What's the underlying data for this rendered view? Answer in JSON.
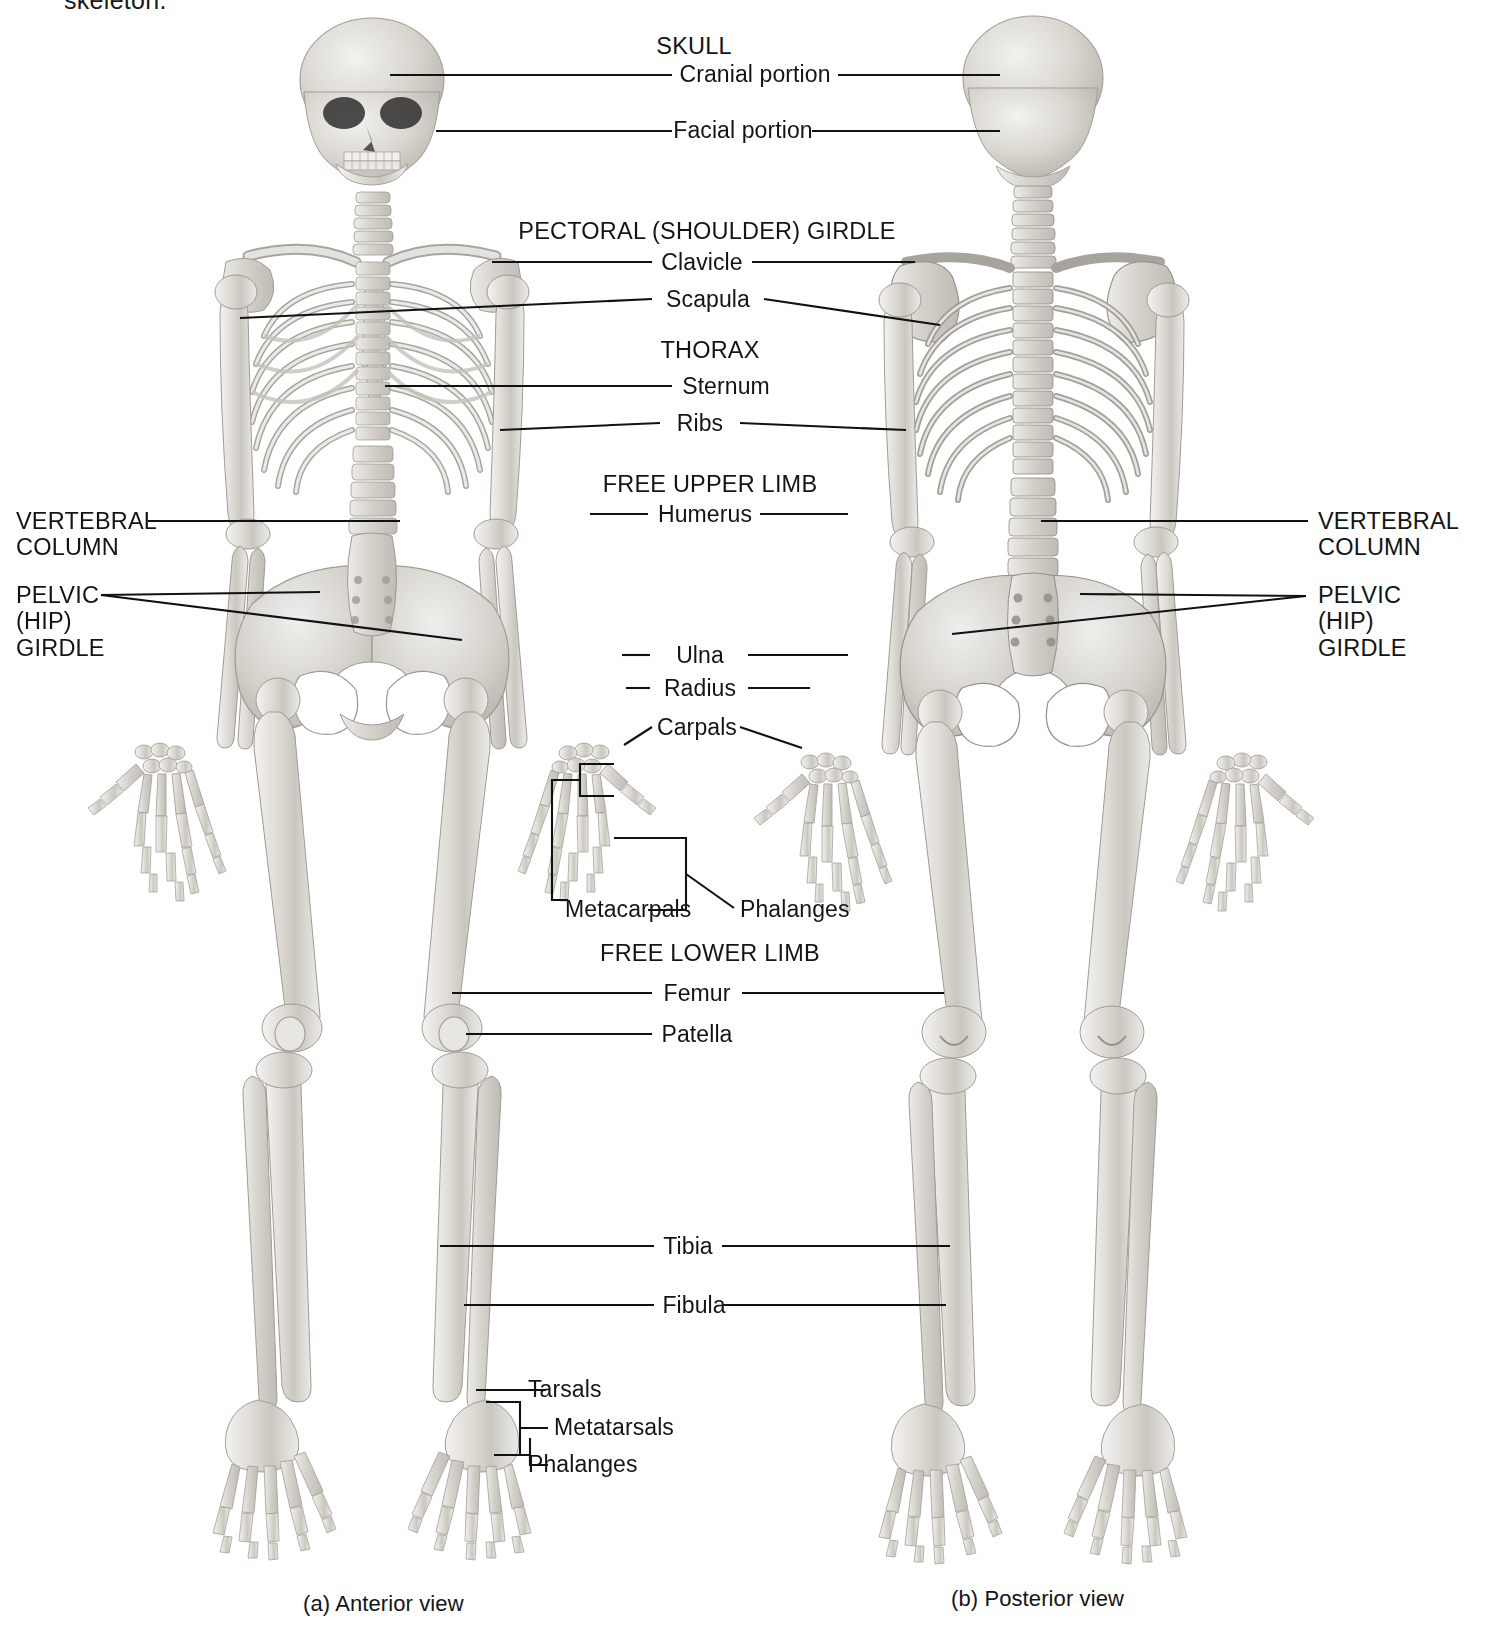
{
  "figure": {
    "type": "anatomy-diagram",
    "partial_top_text": "skeleton.",
    "background_color": "#ffffff",
    "bone_color": "#d9d7d2",
    "line_color": "#111111",
    "text_color": "#141414"
  },
  "captions": {
    "left": "(a) Anterior view",
    "right": "(b) Posterior view"
  },
  "group_headings": [
    {
      "id": "skull",
      "text": "SKULL"
    },
    {
      "id": "pectoral",
      "text": "PECTORAL (SHOULDER) GIRDLE"
    },
    {
      "id": "thorax",
      "text": "THORAX"
    },
    {
      "id": "free_upper",
      "text": "FREE UPPER LIMB"
    },
    {
      "id": "free_lower",
      "text": "FREE LOWER LIMB"
    }
  ],
  "center_labels": [
    {
      "id": "cranial_portion",
      "text": "Cranial portion"
    },
    {
      "id": "facial_portion",
      "text": "Facial portion"
    },
    {
      "id": "clavicle",
      "text": "Clavicle"
    },
    {
      "id": "scapula",
      "text": "Scapula"
    },
    {
      "id": "sternum",
      "text": "Sternum"
    },
    {
      "id": "ribs",
      "text": "Ribs"
    },
    {
      "id": "humerus",
      "text": "Humerus"
    },
    {
      "id": "ulna",
      "text": "Ulna"
    },
    {
      "id": "radius",
      "text": "Radius"
    },
    {
      "id": "carpals",
      "text": "Carpals"
    },
    {
      "id": "metacarpals",
      "text": "Metacarpals"
    },
    {
      "id": "phalanges_hand",
      "text": "Phalanges"
    },
    {
      "id": "femur",
      "text": "Femur"
    },
    {
      "id": "patella",
      "text": "Patella"
    },
    {
      "id": "tibia",
      "text": "Tibia"
    },
    {
      "id": "fibula",
      "text": "Fibula"
    },
    {
      "id": "tarsals",
      "text": "Tarsals"
    },
    {
      "id": "metatarsals",
      "text": "Metatarsals"
    },
    {
      "id": "phalanges_foot",
      "text": "Phalanges"
    }
  ],
  "side_labels": {
    "left": [
      {
        "id": "vertebral_column_left",
        "line1": "VERTEBRAL",
        "line2": "COLUMN"
      },
      {
        "id": "pelvic_girdle_left",
        "line1": "PELVIC",
        "line2": "(HIP)",
        "line3": "GIRDLE"
      }
    ],
    "right": [
      {
        "id": "vertebral_column_right",
        "line1": "VERTEBRAL",
        "line2": "COLUMN"
      },
      {
        "id": "pelvic_girdle_right",
        "line1": "PELVIC",
        "line2": "(HIP)",
        "line3": "GIRDLE"
      }
    ]
  }
}
